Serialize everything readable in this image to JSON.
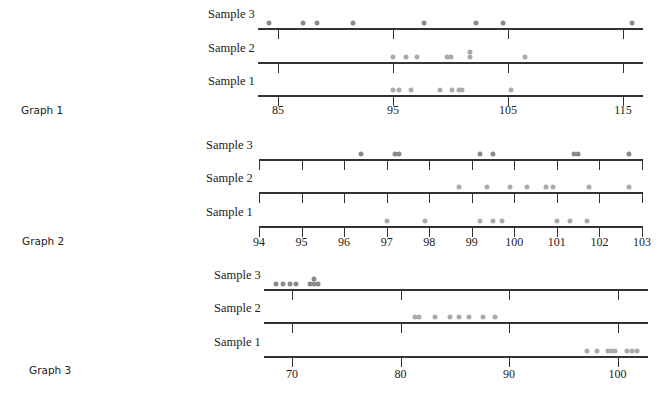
{
  "chart_data": [
    {
      "type": "scatter",
      "subtype": "dot-plot",
      "title": "Graph 1",
      "xticks": [
        85,
        95,
        105,
        115
      ],
      "xlim": [
        83.3,
        117.0
      ],
      "series": [
        {
          "name": "Sample 3",
          "values": [
            84.2,
            87.2,
            88.4,
            91.5,
            97.7,
            102.2,
            104.6,
            115.8
          ],
          "color": "#8a8a8a"
        },
        {
          "name": "Sample 2",
          "values": [
            95.0,
            96.1,
            97.1,
            99.7,
            100.0,
            101.7,
            101.7,
            106.5
          ],
          "color": "#aaaaaa"
        },
        {
          "name": "Sample 1",
          "values": [
            95.0,
            95.5,
            96.6,
            99.1,
            100.1,
            100.7,
            101.0,
            105.3
          ],
          "color": "#aaaaaa"
        }
      ]
    },
    {
      "type": "scatter",
      "subtype": "dot-plot",
      "title": "Graph 2",
      "xticks": [
        94,
        95,
        96,
        97,
        98,
        99,
        100,
        101,
        102,
        103
      ],
      "xlim": [
        93.95,
        103.05
      ],
      "series": [
        {
          "name": "Sample 3",
          "values": [
            96.4,
            97.2,
            97.3,
            99.2,
            99.5,
            101.4,
            101.5,
            102.7
          ],
          "color": "#8a8a8a"
        },
        {
          "name": "Sample 2",
          "values": [
            98.7,
            99.35,
            99.9,
            100.3,
            100.75,
            100.9,
            101.75,
            102.7
          ],
          "color": "#aaaaaa"
        },
        {
          "name": "Sample 1",
          "values": [
            97.0,
            97.9,
            99.2,
            99.5,
            99.7,
            101.0,
            101.3,
            101.7
          ],
          "color": "#aaaaaa"
        }
      ]
    },
    {
      "type": "scatter",
      "subtype": "dot-plot",
      "title": "Graph 3",
      "xticks": [
        70,
        80,
        90,
        100
      ],
      "xlim": [
        67.4,
        102.8
      ],
      "series": [
        {
          "name": "Sample 3",
          "values": [
            68.5,
            69.2,
            69.8,
            70.4,
            71.7,
            72.0,
            72.0,
            72.4
          ],
          "color": "#8a8a8a"
        },
        {
          "name": "Sample 2",
          "values": [
            81.3,
            81.7,
            83.2,
            84.6,
            85.4,
            86.3,
            87.6,
            88.7
          ],
          "color": "#aaaaaa"
        },
        {
          "name": "Sample 1",
          "values": [
            97.2,
            98.1,
            99.1,
            99.5,
            99.8,
            100.9,
            101.3,
            101.8
          ],
          "color": "#aaaaaa"
        }
      ]
    }
  ],
  "layout": [
    {
      "label_pos": [
        21,
        111
      ],
      "axis_x": [
        258,
        643
      ],
      "px_per_unit": 11.5,
      "origin_value": 85,
      "origin_px": 278,
      "rows_y": [
        29,
        63,
        96
      ],
      "sample_label_x": 208,
      "tick_label_y": 103
    },
    {
      "label_pos": [
        22,
        242
      ],
      "axis_x": [
        259,
        643
      ],
      "px_per_unit": 42.55,
      "origin_value": 94,
      "origin_px": 259,
      "rows_y": [
        160,
        193,
        227
      ],
      "sample_label_x": 206,
      "tick_label_y": 235
    },
    {
      "label_pos": [
        29,
        371
      ],
      "axis_x": [
        264,
        648
      ],
      "px_per_unit": 10.85,
      "origin_value": 70,
      "origin_px": 292,
      "rows_y": [
        290,
        323,
        357
      ],
      "sample_label_x": 214,
      "tick_label_y": 367
    }
  ]
}
